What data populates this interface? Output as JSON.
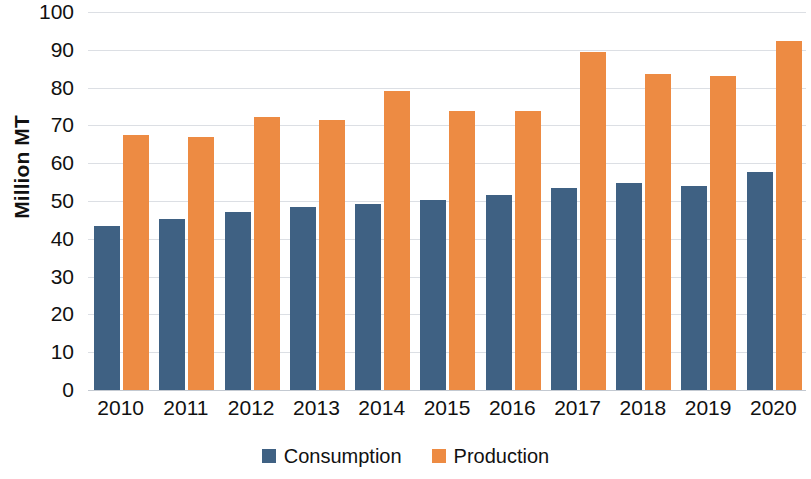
{
  "chart_data": {
    "type": "bar",
    "title": "",
    "subtitle": "",
    "xlabel": "",
    "ylabel": "Million MT",
    "ylim": [
      0,
      100
    ],
    "ytick_step": 10,
    "yticks": [
      "100",
      "90",
      "80",
      "70",
      "60",
      "50",
      "40",
      "30",
      "20",
      "10",
      "0"
    ],
    "grid": true,
    "legend_position": "bottom",
    "categories": [
      "2010",
      "2011",
      "2012",
      "2013",
      "2014",
      "2015",
      "2016",
      "2017",
      "2018",
      "2019",
      "2020"
    ],
    "series": [
      {
        "name": "Consumption",
        "color": "#3f6183",
        "values": [
          43.3,
          45.3,
          47.0,
          48.3,
          49.2,
          50.2,
          51.5,
          53.5,
          54.8,
          54.0,
          57.8
        ]
      },
      {
        "name": "Production",
        "color": "#ed8b43",
        "values": [
          67.5,
          67.0,
          72.2,
          71.5,
          79.2,
          73.7,
          73.7,
          89.5,
          83.5,
          83.2,
          92.3
        ]
      }
    ]
  },
  "legend": {
    "items": [
      {
        "label": "Consumption",
        "color": "#3f6183"
      },
      {
        "label": "Production",
        "color": "#ed8b43"
      }
    ]
  },
  "axes": {
    "y_title": "Million MT"
  }
}
